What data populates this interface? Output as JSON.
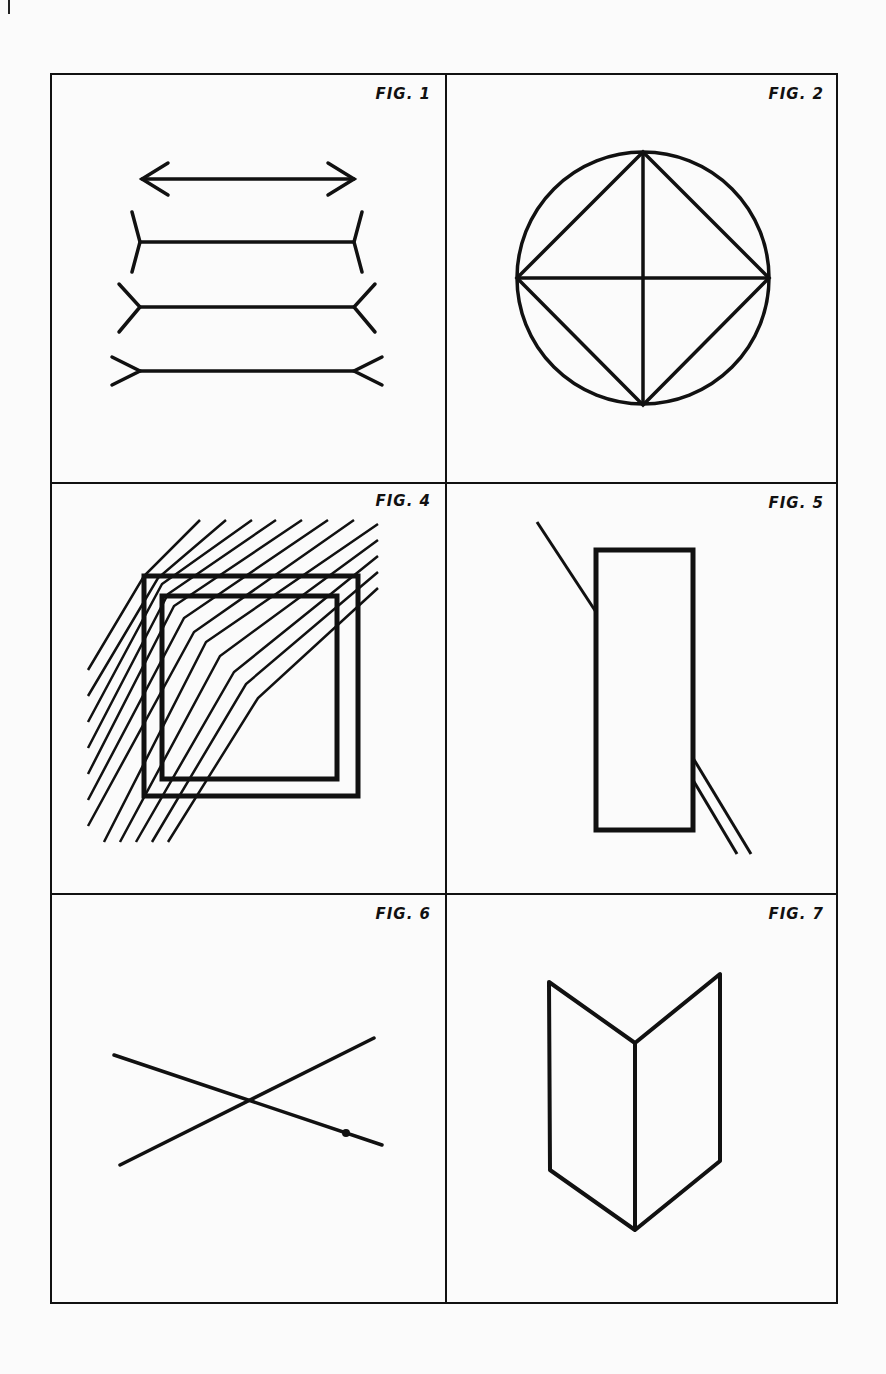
{
  "figures": [
    {
      "id": "fig1",
      "label": "FIG. 1",
      "description": "Muller-Lyer illusion: double arrow and three lines with fins"
    },
    {
      "id": "fig2",
      "label": "FIG. 2",
      "description": "Circle with inscribed diamond and cross"
    },
    {
      "id": "fig4",
      "label": "FIG. 4",
      "description": "Two nested squares overlaid by bent diagonal hatching lines"
    },
    {
      "id": "fig5",
      "label": "FIG. 5",
      "description": "Poggendorff illusion: tall rectangle with oblique line segments"
    },
    {
      "id": "fig6",
      "label": "FIG. 6",
      "description": "Two crossing lines forming an X"
    },
    {
      "id": "fig7",
      "label": "FIG. 7",
      "description": "Folded card / open book shape (ambiguous figure)"
    }
  ],
  "colors": {
    "ink": "#111111",
    "paper": "#fbfbfb"
  }
}
